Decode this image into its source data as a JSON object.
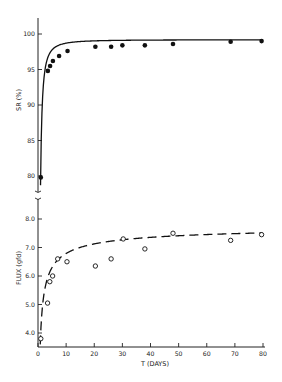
{
  "chart_data": [
    {
      "type": "scatter",
      "title": "",
      "xlabel": "T (DAYS)",
      "ylabel": "SR (%)",
      "xlim": [
        0,
        80
      ],
      "ylim": [
        80,
        100
      ],
      "x_ticks": [],
      "y_ticks": [
        80,
        85,
        90,
        95,
        100
      ],
      "y_tick_labels": [
        "80",
        "85",
        "90",
        "95",
        "100"
      ],
      "grid": false,
      "series": [
        {
          "name": "SR",
          "marker": "filled-circle",
          "line": "solid-fit",
          "x": [
            1,
            3.5,
            4.3,
            5.3,
            7.5,
            10.5,
            20.4,
            26,
            30,
            38,
            48,
            68.5,
            79.5
          ],
          "y": [
            79.8,
            94.8,
            95.5,
            96.2,
            96.9,
            97.6,
            98.2,
            98.2,
            98.4,
            98.4,
            98.6,
            98.9,
            99.0
          ]
        }
      ]
    },
    {
      "type": "scatter",
      "title": "",
      "xlabel": "T (DAYS)",
      "ylabel": "FLUX (gfd)",
      "xlim": [
        0,
        80
      ],
      "ylim": [
        4.0,
        8.0
      ],
      "x_ticks": [
        0,
        10,
        20,
        30,
        40,
        50,
        60,
        70,
        80
      ],
      "x_tick_labels": [
        "0",
        "10",
        "20",
        "30",
        "40",
        "50",
        "60",
        "70",
        "80"
      ],
      "y_ticks": [
        4.0,
        5.0,
        6.0,
        7.0,
        8.0
      ],
      "y_tick_labels": [
        "4.0",
        "5.0",
        "6.0",
        "7.0",
        "8.0"
      ],
      "grid": false,
      "series": [
        {
          "name": "Flux",
          "marker": "open-circle",
          "line": "dashed-fit",
          "x": [
            1,
            3.4,
            4.2,
            5.2,
            7,
            10.3,
            20.4,
            26,
            30.3,
            38,
            48,
            68.5,
            79.5
          ],
          "y": [
            3.8,
            5.05,
            5.8,
            6.0,
            6.6,
            6.5,
            6.35,
            6.6,
            7.3,
            6.95,
            7.5,
            7.25,
            7.45
          ]
        }
      ]
    }
  ],
  "labels": {
    "sr_axis": "SR (%)",
    "flux_axis": "FLUX (gfd)",
    "x_axis": "T (DAYS)"
  }
}
